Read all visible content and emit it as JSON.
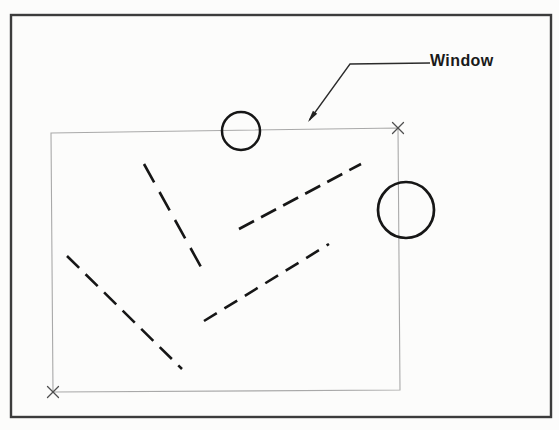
{
  "figure": {
    "label": {
      "text": "Window"
    },
    "colors": {
      "paper": "#fcfcfb",
      "outer_border": "#3c3c3c",
      "window_stroke": "#a9a9a9",
      "corner_marker": "#4f4f4f",
      "leader": "#2b2b2b",
      "ink": "#161616",
      "label_text": "#1a1a1a"
    },
    "canvas": {
      "width": 559,
      "height": 430
    },
    "shapes": [
      {
        "type": "rect",
        "name": "outer-border",
        "x": 11,
        "y": 15,
        "w": 540,
        "h": 402,
        "stroke": "#3c3c3c",
        "width": 2.4,
        "fill": "none"
      },
      {
        "type": "polygon",
        "name": "selection-window",
        "points": "51,133 398,128 400,390 53,392",
        "stroke": "#a9a9a9",
        "width": 1.1,
        "fill": "none"
      },
      {
        "type": "xmark",
        "name": "corner-marker-top-right",
        "x": 398,
        "y": 128,
        "size": 11,
        "stroke": "#4f4f4f",
        "width": 1.3
      },
      {
        "type": "xmark",
        "name": "corner-marker-bottom-left",
        "x": 53,
        "y": 392,
        "size": 11,
        "stroke": "#4f4f4f",
        "width": 1.3
      },
      {
        "type": "polyline",
        "name": "leader-line",
        "points": "430,63 350,64 309.5,120",
        "stroke": "#2b2b2b",
        "width": 1.3,
        "fill": "none"
      },
      {
        "type": "polygon",
        "name": "leader-arrowhead",
        "points": "308,122 312.9,110.8 317.2,113.8",
        "stroke": "none",
        "width": 0,
        "fill": "#222222"
      },
      {
        "type": "circle",
        "name": "small-circle",
        "cx": 241,
        "cy": 131,
        "r": 19,
        "stroke": "#161616",
        "width": 2.5,
        "fill": "none"
      },
      {
        "type": "circle",
        "name": "large-circle",
        "cx": 406,
        "cy": 210,
        "r": 28,
        "stroke": "#161616",
        "width": 2.7,
        "fill": "none"
      },
      {
        "type": "line",
        "name": "dashed-line-upper-left",
        "x1": 144,
        "y1": 164,
        "x2": 201,
        "y2": 267,
        "stroke": "#161616",
        "width": 2.6,
        "dash": "21 11"
      },
      {
        "type": "line",
        "name": "dashed-line-upper-right",
        "x1": 239,
        "y1": 229,
        "x2": 361,
        "y2": 164,
        "stroke": "#161616",
        "width": 2.6,
        "dash": "17 8"
      },
      {
        "type": "line",
        "name": "dashed-line-lower-left",
        "x1": 67,
        "y1": 256,
        "x2": 182,
        "y2": 369,
        "stroke": "#161616",
        "width": 2.6,
        "dash": "17 9"
      },
      {
        "type": "line",
        "name": "dashed-line-lower-right",
        "x1": 204,
        "y1": 321,
        "x2": 329,
        "y2": 244,
        "stroke": "#161616",
        "width": 2.6,
        "dash": "15 9"
      }
    ]
  }
}
